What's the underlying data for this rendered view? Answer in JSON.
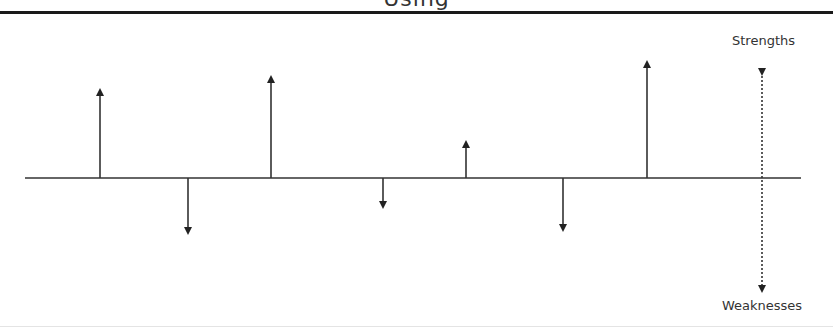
{
  "title": "Using",
  "labels": {
    "strengths": "Strengths",
    "weaknesses": "Weaknesses"
  },
  "baseline": {
    "x1": 25,
    "x2": 801,
    "y": 178
  },
  "arrows": [
    {
      "x": 100,
      "direction": "up",
      "tip_y": 88
    },
    {
      "x": 188,
      "direction": "down",
      "tip_y": 235
    },
    {
      "x": 271,
      "direction": "up",
      "tip_y": 75
    },
    {
      "x": 383,
      "direction": "down",
      "tip_y": 209
    },
    {
      "x": 466,
      "direction": "up",
      "tip_y": 140
    },
    {
      "x": 563,
      "direction": "down",
      "tip_y": 232
    },
    {
      "x": 647,
      "direction": "up",
      "tip_y": 60
    }
  ],
  "scale_axis": {
    "x": 762,
    "top_y": 68,
    "bottom_y": 293,
    "style": "dotted",
    "top_label": "Strengths",
    "bottom_label": "Weaknesses"
  },
  "colors": {
    "line": "#333333",
    "rule": "#1a1a1a"
  }
}
